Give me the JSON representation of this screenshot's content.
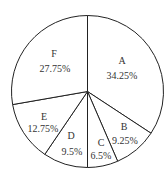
{
  "chart_data": {
    "type": "pie",
    "title": "",
    "categories": [
      "A",
      "B",
      "C",
      "D",
      "E",
      "F"
    ],
    "values": [
      34.25,
      9.25,
      6.5,
      9.5,
      12.75,
      27.75
    ],
    "labels": [
      "34.25%",
      "9.25%",
      "6.5%",
      "9.5%",
      "12.75%",
      "27.75%"
    ],
    "start_angle": "12 o'clock, clockwise",
    "legend": "none"
  },
  "slices": [
    {
      "name": "A",
      "pct": "34.25%",
      "lx": 122,
      "ly": 64,
      "px": 122,
      "py": 79
    },
    {
      "name": "B",
      "pct": "9.25%",
      "lx": 124,
      "ly": 130,
      "px": 125,
      "py": 144
    },
    {
      "name": "C",
      "pct": "6.5%",
      "lx": 101,
      "ly": 146,
      "px": 101,
      "py": 159
    },
    {
      "name": "D",
      "pct": "9.5%",
      "lx": 71,
      "ly": 139,
      "px": 72,
      "py": 155
    },
    {
      "name": "E",
      "pct": "12.75%",
      "lx": 44,
      "ly": 120,
      "px": 43,
      "py": 132
    },
    {
      "name": "F",
      "pct": "27.75%",
      "lx": 54,
      "ly": 57,
      "px": 55,
      "py": 72
    }
  ]
}
